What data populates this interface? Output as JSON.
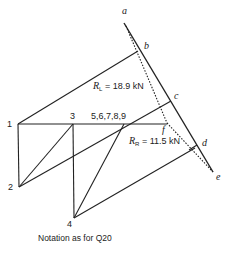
{
  "diagram": {
    "type": "force-polygon-and-truss-diagram",
    "colors": {
      "line": "#222222",
      "background": "#ffffff"
    },
    "force_polygon_points": [
      {
        "id": "a",
        "label": "a"
      },
      {
        "id": "b",
        "label": "b"
      },
      {
        "id": "c",
        "label": "c"
      },
      {
        "id": "d",
        "label": "d"
      },
      {
        "id": "e",
        "label": "e"
      },
      {
        "id": "f",
        "label": "f"
      }
    ],
    "nodes": [
      {
        "id": "1",
        "label": "1"
      },
      {
        "id": "2",
        "label": "2"
      },
      {
        "id": "3",
        "label": "3"
      },
      {
        "id": "4",
        "label": "4"
      },
      {
        "id": "5-9",
        "label": "5,6,7,8,9"
      }
    ],
    "reactions": {
      "left": {
        "symbol": "R",
        "subscript": "L",
        "text": " = 18.9 kN"
      },
      "right": {
        "symbol": "R",
        "subscript": "R",
        "text": " = 11.5 kN"
      }
    },
    "caption": "Notation as for Q20"
  }
}
